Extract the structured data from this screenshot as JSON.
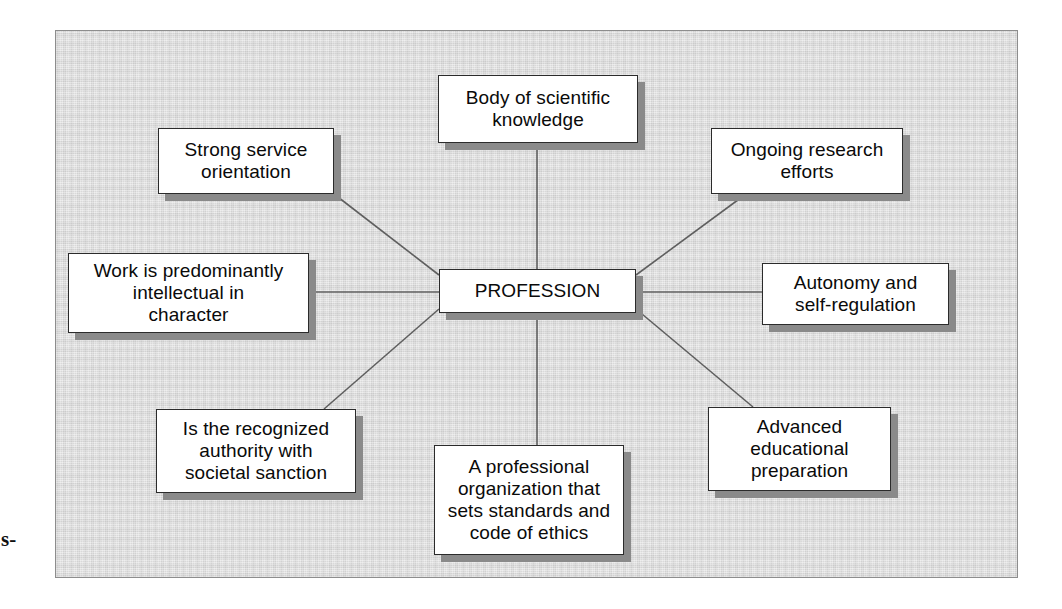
{
  "page": {
    "background_color": "#ffffff",
    "panel_color": "#d9d9d9",
    "frame_border_color": "#8d8d8d",
    "node_fill_color": "#ffffff",
    "node_border_color": "#2b2b2b",
    "node_shadow_color": "#8a8a8a",
    "connector_color": "#5f5f5f",
    "margin_fragment": "s-"
  },
  "diagram": {
    "type": "radial-concept-map",
    "center": {
      "label": "PROFESSION"
    },
    "nodes": [
      {
        "id": "body-of-scientific-knowledge",
        "label": "Body of scientific\nknowledge"
      },
      {
        "id": "ongoing-research-efforts",
        "label": "Ongoing research\nefforts"
      },
      {
        "id": "autonomy-and-self-regulation",
        "label": "Autonomy and\nself-regulation"
      },
      {
        "id": "advanced-educational-preparation",
        "label": "Advanced\neducational\npreparation"
      },
      {
        "id": "professional-organization",
        "label": "A professional\norganization that\nsets standards and\ncode of ethics"
      },
      {
        "id": "recognized-authority",
        "label": "Is the recognized\nauthority with\nsocietal sanction"
      },
      {
        "id": "work-predominantly-intellectual",
        "label": "Work is predominantly\nintellectual in\ncharacter"
      },
      {
        "id": "strong-service-orientation",
        "label": "Strong service\norientation"
      }
    ],
    "edges": [
      {
        "from": "PROFESSION",
        "to": "body-of-scientific-knowledge"
      },
      {
        "from": "PROFESSION",
        "to": "ongoing-research-efforts"
      },
      {
        "from": "PROFESSION",
        "to": "autonomy-and-self-regulation"
      },
      {
        "from": "PROFESSION",
        "to": "advanced-educational-preparation"
      },
      {
        "from": "PROFESSION",
        "to": "professional-organization"
      },
      {
        "from": "PROFESSION",
        "to": "recognized-authority"
      },
      {
        "from": "PROFESSION",
        "to": "work-predominantly-intellectual"
      },
      {
        "from": "PROFESSION",
        "to": "strong-service-orientation"
      }
    ]
  }
}
